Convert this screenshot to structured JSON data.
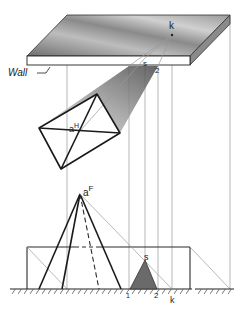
{
  "diagram": {
    "type": "descriptive-geometry shadow construction",
    "labels": {
      "wall": "Wall",
      "k_top": "k",
      "s_top": "s",
      "two_top": "2",
      "a_plan": "a",
      "a_plan_sup": "H",
      "a_front": "a",
      "a_front_sup": "F",
      "s_front": "s",
      "one_front": "1",
      "two_front": "2",
      "k_front": "k"
    },
    "colors": {
      "line": "#1a1a1a",
      "projector": "#9a9a9a",
      "shadow_dark": "#5a5a5a",
      "shadow_light": "#d8d8d8",
      "wall_top_dark": "#7a7a7a",
      "wall_top_light": "#e8e8e8"
    }
  }
}
